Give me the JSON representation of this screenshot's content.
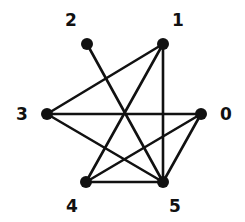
{
  "graph": {
    "nodes": [
      {
        "id": "0",
        "label": "0",
        "x": 201,
        "y": 114,
        "lx": 226,
        "ly": 120
      },
      {
        "id": "1",
        "label": "1",
        "x": 163,
        "y": 44,
        "lx": 178,
        "ly": 26
      },
      {
        "id": "2",
        "label": "2",
        "x": 87,
        "y": 44,
        "lx": 71,
        "ly": 26
      },
      {
        "id": "3",
        "label": "3",
        "x": 47,
        "y": 114,
        "lx": 22,
        "ly": 120
      },
      {
        "id": "4",
        "label": "4",
        "x": 86,
        "y": 182,
        "lx": 72,
        "ly": 212
      },
      {
        "id": "5",
        "label": "5",
        "x": 163,
        "y": 182,
        "lx": 175,
        "ly": 212
      }
    ],
    "edges": [
      [
        "2",
        "5"
      ],
      [
        "1",
        "3"
      ],
      [
        "1",
        "4"
      ],
      [
        "1",
        "5"
      ],
      [
        "3",
        "0"
      ],
      [
        "3",
        "5"
      ],
      [
        "0",
        "4"
      ],
      [
        "0",
        "5"
      ],
      [
        "4",
        "5"
      ]
    ],
    "colors": {
      "stroke": "#111111",
      "node": "#111111",
      "background": "#ffffff"
    }
  }
}
